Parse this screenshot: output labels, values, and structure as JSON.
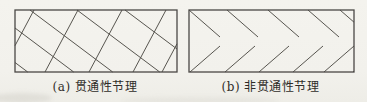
{
  "figure": {
    "colors": {
      "paper": "#f2f1ec",
      "joint_line": "#57554f",
      "rect_border": "#4a4845",
      "caption_text": "#2e2c28"
    },
    "panels": [
      {
        "id": "a",
        "caption": "(a) 贯通性节理",
        "rect": {
          "x": 14,
          "y": 9,
          "w": 162,
          "h": 62
        },
        "lines": [
          [
            19,
            0,
            0,
            35.7
          ],
          [
            63,
            0,
            30,
            62
          ],
          [
            107,
            0,
            74,
            62
          ],
          [
            151,
            0,
            118,
            62
          ],
          [
            162,
            33.8,
            147,
            62
          ],
          [
            0,
            52.5,
            12.7,
            62
          ],
          [
            0,
            18,
            58.7,
            62
          ],
          [
            15,
            0,
            97.7,
            62
          ],
          [
            62,
            0,
            144.7,
            62
          ],
          [
            110,
            0,
            162,
            39
          ]
        ]
      },
      {
        "id": "b",
        "caption": "(b) 非贯通性节理",
        "rect": {
          "x": 188,
          "y": 9,
          "w": 165,
          "h": 62
        },
        "lines": [
          [
            0,
            0,
            31,
            27
          ],
          [
            38,
            0,
            69,
            27
          ],
          [
            79,
            0,
            110,
            27
          ],
          [
            119,
            0,
            150,
            27
          ],
          [
            151,
            0,
            165,
            12.2
          ],
          [
            1,
            62,
            31,
            36
          ],
          [
            36,
            62,
            66,
            36
          ],
          [
            70,
            62,
            100,
            36
          ],
          [
            104,
            62,
            134,
            36
          ],
          [
            135,
            62,
            165,
            36
          ],
          [
            164,
            62,
            165,
            61.1
          ]
        ]
      }
    ]
  }
}
